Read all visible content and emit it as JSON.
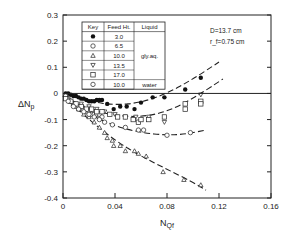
{
  "chart_data": {
    "type": "scatter",
    "title": "",
    "xlabel": "N_Qf",
    "ylabel": "ΔN_p",
    "xlim": [
      0,
      0.16
    ],
    "ylim": [
      -0.4,
      0.3
    ],
    "x_ticks": [
      "0",
      "0.04",
      "0.08",
      "0.12",
      "0.16"
    ],
    "y_ticks": [
      "0.3",
      "0.2",
      "0.1",
      "0",
      "-0.1",
      "-0.2",
      "-0.3",
      "-0.4"
    ],
    "grid": false,
    "zero_line": true,
    "annotations": [
      "D=13.7 cm",
      "r_f=0.75 cm"
    ],
    "legend": {
      "position": "upper-left",
      "headers": [
        "Key",
        "Feed Ht.",
        "Liquid"
      ],
      "rows": [
        {
          "key": "filled-circle",
          "feed_ht": "3.0",
          "liquid": ""
        },
        {
          "key": "open-circle",
          "feed_ht": "6.5",
          "liquid": ""
        },
        {
          "key": "triangle-up",
          "feed_ht": "10.0",
          "liquid": "gly.aq."
        },
        {
          "key": "triangle-down",
          "feed_ht": "13.5",
          "liquid": ""
        },
        {
          "key": "square",
          "feed_ht": "17.0",
          "liquid": ""
        },
        {
          "key": "open-circle",
          "feed_ht": "10.0",
          "liquid": "water"
        }
      ]
    },
    "series": [
      {
        "name": "Feed Ht. 3.0 (gly.aq.)",
        "marker": "filled-circle",
        "x": [
          0.002,
          0.004,
          0.006,
          0.008,
          0.01,
          0.012,
          0.014,
          0.016,
          0.018,
          0.02,
          0.022,
          0.024,
          0.026,
          0.028,
          0.03,
          0.034,
          0.039,
          0.044,
          0.049,
          0.055,
          0.06,
          0.069,
          0.078,
          0.094,
          0.106
        ],
        "y": [
          0.0,
          0.0,
          -0.005,
          -0.01,
          -0.01,
          -0.015,
          -0.02,
          -0.02,
          -0.025,
          -0.03,
          -0.03,
          -0.03,
          -0.025,
          -0.025,
          -0.025,
          -0.04,
          -0.06,
          -0.05,
          -0.05,
          -0.06,
          -0.035,
          -0.015,
          -0.015,
          0.015,
          0.06
        ]
      },
      {
        "name": "Feed Ht. 6.5 (gly.aq.)",
        "marker": "open-circle",
        "x": [
          0.002,
          0.004,
          0.006,
          0.008,
          0.01,
          0.012,
          0.014,
          0.016,
          0.018,
          0.02,
          0.022,
          0.024,
          0.026,
          0.028,
          0.03
        ],
        "y": [
          -0.01,
          -0.02,
          -0.03,
          -0.04,
          -0.05,
          -0.05,
          -0.06,
          -0.06,
          -0.07,
          -0.07,
          -0.08,
          -0.08,
          -0.08,
          -0.08,
          -0.09
        ]
      },
      {
        "name": "Feed Ht. 10.0 (gly.aq.)",
        "marker": "triangle-up",
        "x": [
          0.004,
          0.008,
          0.012,
          0.016,
          0.02,
          0.024,
          0.028,
          0.032,
          0.034,
          0.038,
          0.039,
          0.044,
          0.048,
          0.055,
          0.058,
          0.064,
          0.077,
          0.093,
          0.106
        ],
        "y": [
          -0.02,
          -0.04,
          -0.06,
          -0.08,
          -0.09,
          -0.11,
          -0.13,
          -0.15,
          -0.17,
          -0.18,
          -0.2,
          -0.2,
          -0.22,
          -0.22,
          -0.23,
          -0.24,
          -0.3,
          -0.33,
          -0.35
        ]
      },
      {
        "name": "Feed Ht. 13.5 (gly.aq.)",
        "marker": "triangle-down",
        "x": [
          0.014,
          0.02,
          0.026,
          0.032,
          0.04,
          0.048,
          0.056,
          0.066,
          0.078,
          0.106
        ],
        "y": [
          -0.04,
          -0.05,
          -0.06,
          -0.07,
          -0.08,
          -0.09,
          -0.09,
          -0.09,
          -0.11,
          -0.005
        ]
      },
      {
        "name": "Feed Ht. 17.0 (gly.aq.)",
        "marker": "square",
        "x": [
          0.002,
          0.006,
          0.01,
          0.014,
          0.018,
          0.022,
          0.026,
          0.03,
          0.036,
          0.042,
          0.048,
          0.054,
          0.058,
          0.06,
          0.066,
          0.078,
          0.094,
          0.094,
          0.106,
          0.106
        ],
        "y": [
          -0.02,
          -0.03,
          -0.04,
          -0.05,
          -0.06,
          -0.06,
          -0.07,
          -0.07,
          -0.08,
          -0.09,
          -0.09,
          -0.1,
          -0.11,
          -0.1,
          -0.1,
          -0.09,
          -0.04,
          -0.06,
          -0.03,
          -0.04
        ]
      },
      {
        "name": "Feed Ht. 10.0 (water)",
        "marker": "open-circle",
        "x": [
          0.004,
          0.008,
          0.012,
          0.016,
          0.02,
          0.024,
          0.028,
          0.032,
          0.038,
          0.048,
          0.058,
          0.062,
          0.08,
          0.098
        ],
        "y": [
          -0.03,
          -0.05,
          -0.06,
          -0.07,
          -0.08,
          -0.09,
          -0.1,
          -0.11,
          -0.12,
          -0.13,
          -0.14,
          -0.14,
          -0.16,
          -0.15
        ]
      }
    ],
    "fit_curves": [
      {
        "name": "fit 3.0",
        "style": "dashed",
        "x": [
          0.0,
          0.02,
          0.04,
          0.06,
          0.08,
          0.1,
          0.12
        ],
        "y": [
          0.0,
          -0.03,
          -0.045,
          -0.035,
          0.0,
          0.055,
          0.12
        ]
      },
      {
        "name": "fit 17.0/13.5",
        "style": "dashed",
        "x": [
          0.0,
          0.02,
          0.04,
          0.06,
          0.08,
          0.1,
          0.123
        ],
        "y": [
          -0.01,
          -0.06,
          -0.085,
          -0.09,
          -0.07,
          -0.02,
          0.055
        ]
      },
      {
        "name": "fit water",
        "style": "dashed",
        "x": [
          0.0,
          0.02,
          0.04,
          0.06,
          0.08,
          0.095,
          0.11
        ],
        "y": [
          -0.01,
          -0.08,
          -0.125,
          -0.15,
          -0.16,
          -0.155,
          -0.14
        ]
      },
      {
        "name": "fit 10.0 gly.aq.",
        "style": "dashed",
        "x": [
          0.0,
          0.02,
          0.04,
          0.06,
          0.08,
          0.1,
          0.11
        ],
        "y": [
          -0.01,
          -0.1,
          -0.18,
          -0.24,
          -0.29,
          -0.34,
          -0.37
        ]
      }
    ]
  }
}
